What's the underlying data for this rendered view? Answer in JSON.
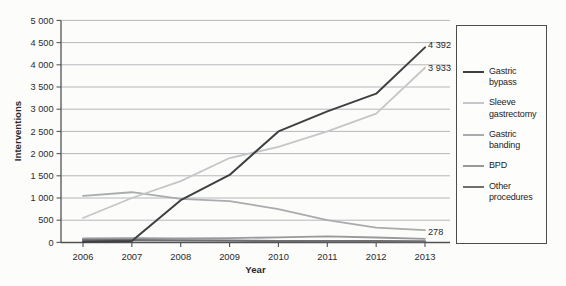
{
  "chart_data": {
    "type": "line",
    "title": "",
    "xlabel": "Year",
    "ylabel": "Interventions",
    "x": [
      "2006",
      "2007",
      "2008",
      "2009",
      "2010",
      "2011",
      "2012",
      "2013"
    ],
    "ylim": [
      0,
      5000
    ],
    "ytick_step": 500,
    "ytick_labels": [
      "0",
      "500",
      "1 000",
      "1 500",
      "2 000",
      "2 500",
      "3 000",
      "3 500",
      "4 000",
      "4 500",
      "5 000"
    ],
    "grid": true,
    "legend_position": "right",
    "series": [
      {
        "name": "Gastric bypass",
        "color": "#3e3f41",
        "width": 2.0,
        "values": [
          15,
          30,
          950,
          1520,
          2500,
          2950,
          3350,
          4392
        ],
        "end_label": "4 392"
      },
      {
        "name": "Sleeve gastrectomy",
        "color": "#c4c6c8",
        "width": 1.8,
        "values": [
          550,
          1000,
          1380,
          1900,
          2150,
          2500,
          2900,
          3933
        ],
        "end_label": "3 933"
      },
      {
        "name": "Gastric banding",
        "color": "#a9abad",
        "width": 1.8,
        "values": [
          1050,
          1130,
          980,
          930,
          750,
          500,
          335,
          278
        ],
        "end_label": "278"
      },
      {
        "name": "BPD",
        "color": "#97999b",
        "width": 1.8,
        "values": [
          90,
          95,
          90,
          95,
          115,
          135,
          110,
          80
        ],
        "end_label": ""
      },
      {
        "name": "Other procedures",
        "color": "#6d6f71",
        "width": 2.2,
        "values": [
          55,
          50,
          45,
          38,
          32,
          30,
          28,
          25
        ],
        "end_label": ""
      }
    ]
  }
}
